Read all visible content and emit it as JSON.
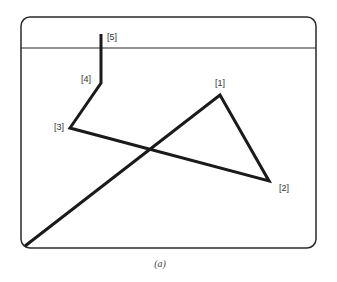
{
  "figure": {
    "caption": "(a)",
    "frame": {
      "x": 21,
      "y": 17,
      "width": 295,
      "height": 231,
      "radius": 9,
      "divider_y": 48
    },
    "colors": {
      "frame": "#2a2a2a",
      "path": "#1a1a1a",
      "label": "#333333"
    },
    "start_point": {
      "x": 25,
      "y": 246
    },
    "points": [
      {
        "label": "[1]",
        "x": 220,
        "y": 95,
        "label_x": 215,
        "label_y": 86
      },
      {
        "label": "[2]",
        "x": 269,
        "y": 181,
        "label_x": 279,
        "label_y": 191
      },
      {
        "label": "[3]",
        "x": 70,
        "y": 128,
        "label_x": 54,
        "label_y": 130
      },
      {
        "label": "[4]",
        "x": 101,
        "y": 83,
        "label_x": 81,
        "label_y": 82
      },
      {
        "label": "[5]",
        "x": 101,
        "y": 34,
        "label_x": 107,
        "label_y": 40
      }
    ]
  }
}
